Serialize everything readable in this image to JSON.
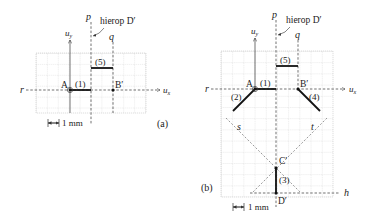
{
  "figure": {
    "panels": [
      {
        "id": "a",
        "caption": "(a)",
        "axis_x_label": "u",
        "axis_x_sub": "x",
        "axis_y_label": "u",
        "axis_y_sub": "y",
        "line_r": "r",
        "line_p": "p",
        "line_q": "q",
        "annotation": "hierop D′",
        "point_A": "A",
        "point_B": "B′",
        "segment_1": "(1)",
        "segment_5": "(5)",
        "scale_label": "1 mm"
      },
      {
        "id": "b",
        "caption": "(b)",
        "axis_x_label": "u",
        "axis_x_sub": "x",
        "axis_y_label": "u",
        "axis_y_sub": "y",
        "line_r": "r",
        "line_p": "p",
        "line_q": "q",
        "line_s": "s",
        "line_t": "t",
        "line_h": "h",
        "annotation": "hierop D′",
        "point_A": "A",
        "point_B": "B′",
        "point_C": "C′",
        "point_D": "D′",
        "segment_1": "(1)",
        "segment_2": "(2)",
        "segment_3": "(3)",
        "segment_4": "(4)",
        "segment_5": "(5)",
        "scale_label": "1 mm"
      }
    ],
    "colors": {
      "grid": "#c8c8c8",
      "line": "#333333",
      "segment": "#111111"
    }
  }
}
